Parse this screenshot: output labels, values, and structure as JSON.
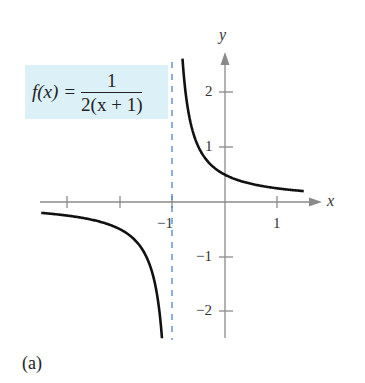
{
  "chart_data": {
    "type": "line",
    "title": "",
    "function": "f(x) = 1/(2(x+1))",
    "formula_label": {
      "lhs": "f(x)",
      "equals": "=",
      "numerator": "1",
      "denominator": "2(x + 1)"
    },
    "xlabel": "x",
    "ylabel": "y",
    "xlim": [
      -3.5,
      1.75
    ],
    "ylim": [
      -2.5,
      2.7
    ],
    "x_ticks": [
      -3,
      -2,
      -1,
      1
    ],
    "x_tick_labels": [
      "-1",
      "1"
    ],
    "y_ticks": [
      -2,
      -1,
      1,
      2
    ],
    "y_tick_labels": [
      "2",
      "1",
      "-1",
      "-2"
    ],
    "vertical_asymptote": -1,
    "horizontal_asymptote": 0,
    "grid": false,
    "series": [
      {
        "name": "left branch",
        "x": [
          -3.5,
          -3,
          -2.5,
          -2,
          -1.5,
          -1.25,
          -1.2
        ],
        "y": [
          -0.2,
          -0.25,
          -0.333,
          -0.5,
          -1.0,
          -2.0,
          -2.5
        ]
      },
      {
        "name": "right branch",
        "x": [
          -0.81,
          -0.75,
          -0.5,
          0,
          0.5,
          1,
          1.5
        ],
        "y": [
          2.63,
          2.0,
          1.0,
          0.5,
          0.333,
          0.25,
          0.2
        ]
      }
    ],
    "colors": {
      "curve": "#111111",
      "asymptote": "#4a86c8",
      "axes": "#8a8a8a",
      "formula_bg": "#dcf1f7"
    }
  },
  "labels": {
    "x_axis": "x",
    "y_axis": "y",
    "x_neg1": "−1",
    "x_pos1": "1",
    "y_2": "2",
    "y_1": "1",
    "y_neg1": "−1",
    "y_neg2": "−2",
    "caption": "(a)"
  }
}
